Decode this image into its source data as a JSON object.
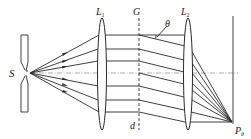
{
  "diagram": {
    "type": "optics-grating-diffraction",
    "labels": {
      "source": "S",
      "lens1": "L",
      "lens1_sub": "1",
      "grating": "G",
      "lens2": "L",
      "lens2_sub": "2",
      "angle": "θ",
      "grating_spacing": "d",
      "point": "P",
      "point_sub": "θ"
    },
    "colors": {
      "line": "#2a2a2a",
      "axis": "#8a8a8a",
      "background": "#ffffff"
    },
    "geometry": {
      "source_point": [
        30,
        73
      ],
      "axis_y": 73,
      "lens1_x": 102,
      "grating_x": 139,
      "lens2_x": 188,
      "screen_x": 232,
      "focus_point": [
        232,
        122
      ],
      "ray_heights_parallel": [
        35,
        49,
        61,
        86,
        100,
        112
      ],
      "diffracted_start_heights": [
        35,
        49,
        61,
        73,
        86,
        100,
        112
      ],
      "diffracted_drop": 11
    }
  }
}
